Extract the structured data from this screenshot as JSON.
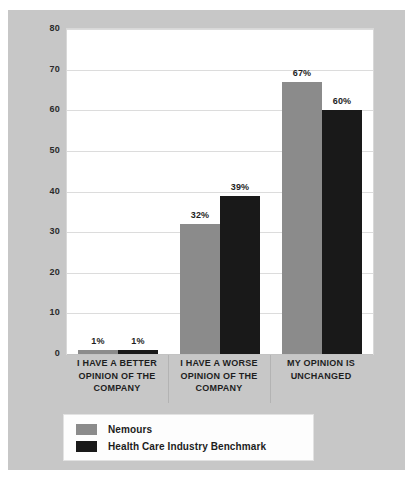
{
  "chart_data": {
    "type": "bar",
    "title": "",
    "subtitle": "",
    "xlabel": "",
    "ylabel": "",
    "ylim": [
      0,
      80
    ],
    "yticks": [
      0,
      10,
      20,
      30,
      40,
      50,
      60,
      70,
      80
    ],
    "grid": true,
    "legend_position": "bottom-left",
    "categories": [
      "I HAVE A BETTER OPINION OF THE COMPANY",
      "I HAVE A WORSE OPINION OF THE COMPANY",
      "MY OPINION IS UNCHANGED"
    ],
    "category_lines": [
      [
        "I HAVE A BETTER",
        "OPINION OF THE",
        "COMPANY"
      ],
      [
        "I HAVE A WORSE",
        "OPINION OF THE",
        "COMPANY"
      ],
      [
        "MY OPINION IS",
        "UNCHANGED"
      ]
    ],
    "series": [
      {
        "name": "Nemours",
        "color": "#8b8b8b",
        "values": [
          1,
          32,
          67
        ],
        "data_labels": [
          "1%",
          "32%",
          "67%"
        ]
      },
      {
        "name": "Health Care Industry Benchmark",
        "color": "#191919",
        "values": [
          1,
          39,
          60
        ],
        "data_labels": [
          "1%",
          "39%",
          "60%"
        ]
      }
    ]
  },
  "colors": {
    "panel_background": "#c7c7c7",
    "plot_background": "#ffffff",
    "gridline": "#dcdcdc",
    "text": "#1e1e1e",
    "series_nemours": "#8b8b8b",
    "series_benchmark": "#191919"
  },
  "axis": {
    "ytick_labels": [
      "80",
      "70",
      "60",
      "50",
      "40",
      "30",
      "20",
      "10",
      "0"
    ]
  },
  "legend": {
    "items": [
      {
        "label": "Nemours",
        "swatch": "#8b8b8b"
      },
      {
        "label": "Health Care Industry Benchmark",
        "swatch": "#191919"
      }
    ]
  }
}
